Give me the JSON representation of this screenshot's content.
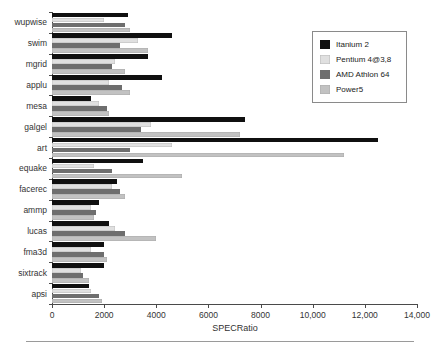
{
  "chart_data": {
    "type": "bar",
    "orientation": "horizontal",
    "title": "",
    "xlabel": "SPECRatio",
    "ylabel": "",
    "xlim": [
      0,
      14000
    ],
    "xticks": [
      0,
      2000,
      4000,
      6000,
      8000,
      10000,
      12000,
      14000
    ],
    "xtick_labels": [
      "0",
      "2000",
      "4000",
      "6000",
      "8000",
      "10,000",
      "12,000",
      "14,000"
    ],
    "grid": false,
    "legend_position": "top-right",
    "categories": [
      "wupwise",
      "swim",
      "mgrid",
      "applu",
      "mesa",
      "galgel",
      "art",
      "equake",
      "facerec",
      "ammp",
      "lucas",
      "fma3d",
      "sixtrack",
      "apsi"
    ],
    "series": [
      {
        "name": "Itanium 2",
        "color": "#101010",
        "values": [
          2900,
          4600,
          3700,
          4200,
          1500,
          7400,
          12500,
          3500,
          2500,
          1800,
          2200,
          2000,
          2000,
          1400
        ]
      },
      {
        "name": "Pentium 4@3,8",
        "color": "#e0e0e0",
        "values": [
          2000,
          3300,
          2400,
          2200,
          1800,
          3800,
          4600,
          1600,
          2300,
          1500,
          2400,
          1500,
          1100,
          1500
        ]
      },
      {
        "name": "AMD Athlon 64",
        "color": "#6e6e6e",
        "values": [
          2800,
          2600,
          2300,
          2700,
          2100,
          3400,
          3000,
          2300,
          2600,
          1700,
          2800,
          2000,
          1200,
          1800
        ]
      },
      {
        "name": "Power5",
        "color": "#c2c2c2",
        "values": [
          3000,
          3700,
          2800,
          3000,
          2200,
          7200,
          11200,
          5000,
          2800,
          1600,
          4000,
          2100,
          1400,
          1900
        ]
      }
    ]
  },
  "legend": {
    "items": [
      {
        "label": "Itanium 2",
        "color": "#101010"
      },
      {
        "label": "Pentium 4@3,8",
        "color": "#e0e0e0"
      },
      {
        "label": "AMD Athlon 64",
        "color": "#6e6e6e"
      },
      {
        "label": "Power5",
        "color": "#c2c2c2"
      }
    ]
  }
}
